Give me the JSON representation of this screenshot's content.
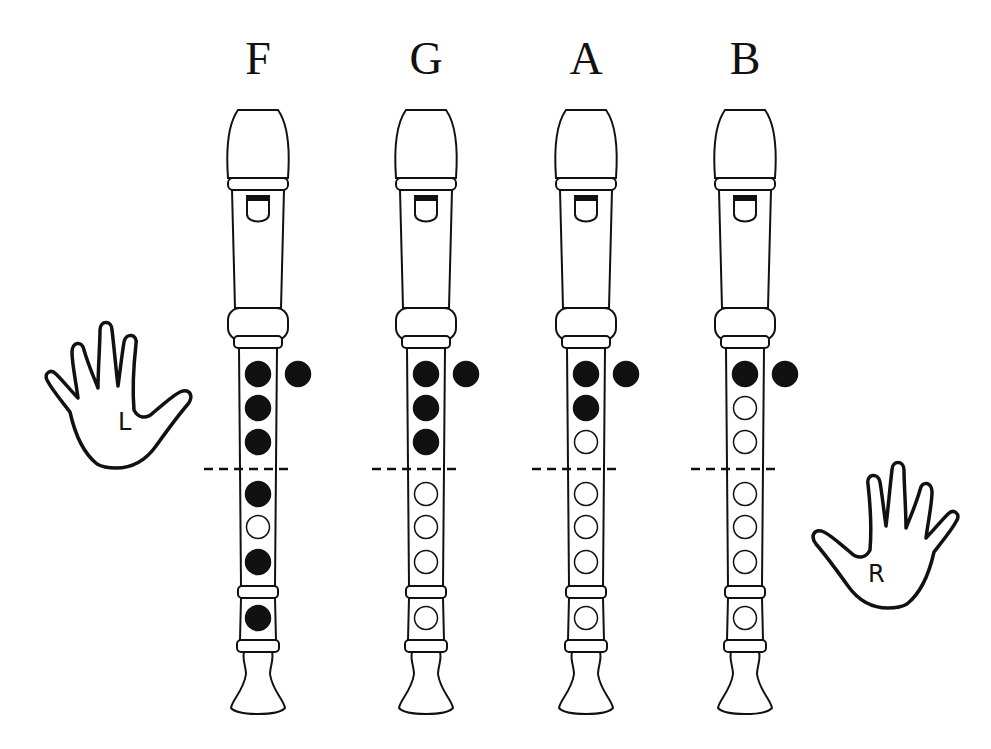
{
  "colors": {
    "ink": "#111111",
    "background": "#ffffff"
  },
  "notes": [
    {
      "label": "F",
      "thumb": "closed",
      "holes": [
        "closed",
        "closed",
        "closed",
        "closed",
        "open",
        "closed",
        "closed"
      ]
    },
    {
      "label": "G",
      "thumb": "closed",
      "holes": [
        "closed",
        "closed",
        "closed",
        "open",
        "open",
        "open",
        "open"
      ]
    },
    {
      "label": "A",
      "thumb": "closed",
      "holes": [
        "closed",
        "closed",
        "open",
        "open",
        "open",
        "open",
        "open"
      ]
    },
    {
      "label": "B",
      "thumb": "closed",
      "holes": [
        "closed",
        "open",
        "open",
        "open",
        "open",
        "open",
        "open"
      ]
    }
  ],
  "hands": {
    "left": {
      "letter": "L"
    },
    "right": {
      "letter": "R"
    }
  }
}
